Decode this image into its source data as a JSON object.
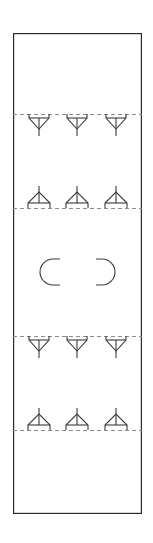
{
  "drawing": {
    "title": "Vertical Plan Strip",
    "canvas": {
      "width": 153,
      "height": 543,
      "background": "#ffffff"
    },
    "frame": {
      "name": "outer-rectangle",
      "x": 13,
      "y": 33,
      "width": 129,
      "height": 481,
      "stroke": "#2b2b2b",
      "stroke_width": 1.2,
      "fill": "#ffffff"
    },
    "guides": {
      "style": "dashed",
      "stroke": "#8a8a8a",
      "stroke_width": 1,
      "dash_pattern": "4 3",
      "x_start": 13,
      "x_end": 142,
      "lines": [
        {
          "name": "guide-line-1",
          "y": 114
        },
        {
          "name": "guide-line-2",
          "y": 208
        },
        {
          "name": "guide-line-3",
          "y": 336
        },
        {
          "name": "guide-line-4",
          "y": 430
        }
      ]
    },
    "symbols": {
      "stroke": "#3a3a3a",
      "stroke_width": 1.1,
      "columns_x": [
        39,
        77,
        116
      ],
      "rows": [
        {
          "name": "symbol-row-1",
          "type": "funnel-down",
          "label": "Downward funnel fixture row 1",
          "baseline_y": 114,
          "count": 3
        },
        {
          "name": "symbol-row-2",
          "type": "frame-up",
          "label": "Upward A-frame fixture row 2",
          "baseline_y": 208,
          "count": 3
        },
        {
          "name": "symbol-row-3",
          "type": "funnel-down",
          "label": "Downward funnel fixture row 3",
          "baseline_y": 336,
          "count": 3
        },
        {
          "name": "symbol-row-4",
          "type": "frame-up",
          "label": "Upward A-frame fixture row 4",
          "baseline_y": 430,
          "count": 3
        }
      ],
      "arc_pair": {
        "name": "arc-pair-group",
        "label": "Opposing half-round arc symbols",
        "center_y": 272,
        "items": [
          {
            "name": "arc-symbol-left",
            "glyph": "C",
            "cx": 53,
            "facing": "left"
          },
          {
            "name": "arc-symbol-right",
            "glyph": "D",
            "cx": 102,
            "facing": "right"
          }
        ],
        "radius": 13,
        "straight_height": 26
      }
    }
  }
}
